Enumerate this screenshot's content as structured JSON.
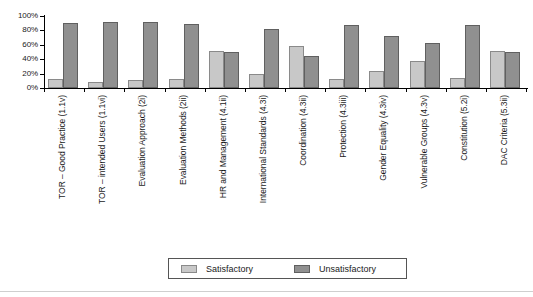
{
  "chart_data": {
    "type": "bar",
    "title": "",
    "xlabel": "",
    "ylabel": "",
    "ylim": [
      0,
      100
    ],
    "yticks": [
      "0%",
      "20%",
      "40%",
      "60%",
      "80%",
      "100%"
    ],
    "ytick_values": [
      0,
      20,
      40,
      60,
      80,
      100
    ],
    "grid": false,
    "legend_position": "bottom",
    "categories": [
      "TOR – Good Practice (1.1v)",
      "TOR – intended Users (1.1vi)",
      "Evaluation Approach (2i)",
      "Evaluation Methods (2ii)",
      "HR and Management (4.1ii)",
      "International Standards (4.3i)",
      "Coordination (4.3ii)",
      "Protection (4.3iii)",
      "Gender Equality (4.3iv)",
      "Vulnerable Groups (4.3v)",
      "Constitution (5.2i)",
      "DAC Criteria (5.3ii)"
    ],
    "series": [
      {
        "name": "Satisfactory",
        "color": "#c8c8c8",
        "values": [
          12,
          9,
          11,
          12,
          52,
          20,
          58,
          12,
          24,
          38,
          14,
          52
        ]
      },
      {
        "name": "Unsatisfactory",
        "color": "#909090",
        "values": [
          90,
          92,
          91,
          89,
          50,
          82,
          44,
          88,
          72,
          62,
          88,
          50
        ]
      }
    ]
  },
  "legend": {
    "entries": [
      {
        "label": "Satisfactory",
        "swatch": "sat"
      },
      {
        "label": "Unsatisfactory",
        "swatch": "unsat"
      }
    ]
  }
}
